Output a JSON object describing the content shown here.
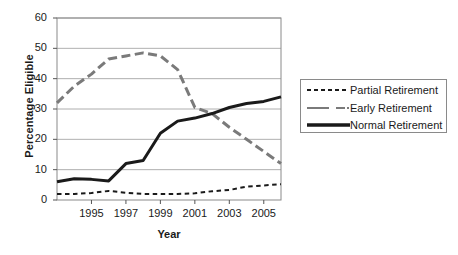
{
  "chart_data": {
    "type": "line",
    "title": "",
    "xlabel": "Year",
    "ylabel": "Percentage Eligible",
    "xlim": [
      1993,
      2006
    ],
    "ylim": [
      0,
      60
    ],
    "ytick_values": [
      0,
      10,
      20,
      30,
      40,
      50,
      60
    ],
    "ytick_labels": [
      "0",
      "10",
      "20",
      "30",
      "40",
      "50",
      "60"
    ],
    "xtick_values": [
      1995,
      1997,
      1999,
      2001,
      2003,
      2005
    ],
    "xtick_labels": [
      "1995",
      "1997",
      "1999",
      "2001",
      "2003",
      "2005"
    ],
    "x": [
      1993,
      1994,
      1995,
      1996,
      1997,
      1998,
      1999,
      2000,
      2001,
      2002,
      2003,
      2004,
      2005,
      2006
    ],
    "grid": "horizontal",
    "legend_position": "right",
    "series": [
      {
        "name": "Partial Retirement",
        "style": "dashed",
        "color": "#1a1a1a",
        "width": 2,
        "values": [
          2,
          2,
          2.3,
          3,
          2.4,
          2,
          2,
          2,
          2.2,
          2.9,
          3.3,
          4.4,
          4.8,
          5.2
        ]
      },
      {
        "name": "Early Retirement",
        "style": "long-dash",
        "color": "#7a7a7a",
        "width": 3,
        "values": [
          32,
          37.5,
          41.5,
          46.5,
          47.5,
          48.5,
          47.5,
          43,
          30.5,
          28.5,
          24,
          20,
          16,
          12
        ]
      },
      {
        "name": "Normal Retirement",
        "style": "solid",
        "color": "#1a1a1a",
        "width": 3,
        "values": [
          6,
          7,
          6.8,
          6.3,
          12,
          13,
          22,
          26,
          27,
          28.5,
          30.5,
          31.8,
          32.5,
          34
        ]
      }
    ],
    "legend": [
      {
        "label": "Partial Retirement",
        "style": "dashed",
        "color": "#1a1a1a"
      },
      {
        "label": "Early Retirement",
        "style": "long-dash",
        "color": "#7a7a7a"
      },
      {
        "label": "Normal Retirement",
        "style": "solid",
        "color": "#1a1a1a"
      }
    ]
  },
  "axes": {
    "y_title": "Percentage Eligible",
    "x_title": "Year"
  },
  "legend": {
    "items": [
      {
        "label": "Partial Retirement"
      },
      {
        "label": "Early Retirement"
      },
      {
        "label": "Normal Retirement"
      }
    ]
  },
  "ticks": {
    "y": [
      "0",
      "10",
      "20",
      "30",
      "40",
      "50",
      "60"
    ],
    "x": [
      "1995",
      "1997",
      "1999",
      "2001",
      "2003",
      "2005"
    ]
  }
}
